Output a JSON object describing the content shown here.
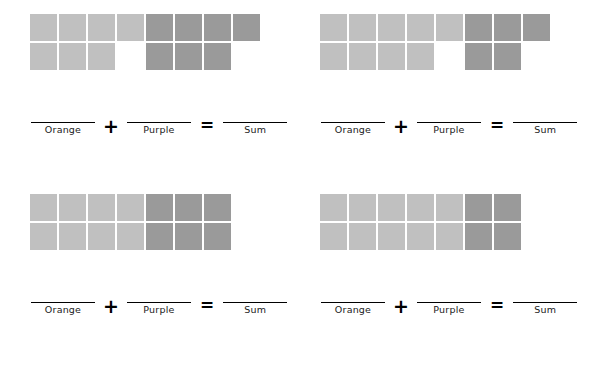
{
  "worksheet": {
    "colors": {
      "light_square": "#c0c0c0",
      "dark_square": "#9a9a9a",
      "line": "#000000",
      "background": "#ffffff"
    },
    "labels": {
      "orange": "Orange",
      "purple": "Purple",
      "sum": "Sum",
      "plus": "+",
      "equals": "="
    },
    "problems": [
      {
        "id": "problem-1",
        "columns": 8,
        "rows": 2,
        "light_top": 4,
        "light_bottom": 3,
        "dark_start_column": 5,
        "dark_top": 4,
        "dark_bottom": 3,
        "light_count": 7,
        "dark_count": 7,
        "sum": 14,
        "orange_answer": "",
        "purple_answer": "",
        "sum_answer": ""
      },
      {
        "id": "problem-2",
        "columns": 8,
        "rows": 2,
        "light_top": 5,
        "light_bottom": 4,
        "dark_start_column": 6,
        "dark_top": 3,
        "dark_bottom": 2,
        "light_count": 9,
        "dark_count": 5,
        "sum": 14,
        "orange_answer": "",
        "purple_answer": "",
        "sum_answer": ""
      },
      {
        "id": "problem-3",
        "columns": 7,
        "rows": 2,
        "light_top": 4,
        "light_bottom": 4,
        "dark_start_column": 5,
        "dark_top": 3,
        "dark_bottom": 3,
        "light_count": 8,
        "dark_count": 6,
        "sum": 14,
        "orange_answer": "",
        "purple_answer": "",
        "sum_answer": ""
      },
      {
        "id": "problem-4",
        "columns": 7,
        "rows": 2,
        "light_top": 5,
        "light_bottom": 5,
        "dark_start_column": 6,
        "dark_top": 2,
        "dark_bottom": 2,
        "light_count": 10,
        "dark_count": 4,
        "sum": 14,
        "orange_answer": "",
        "purple_answer": "",
        "sum_answer": ""
      }
    ]
  }
}
